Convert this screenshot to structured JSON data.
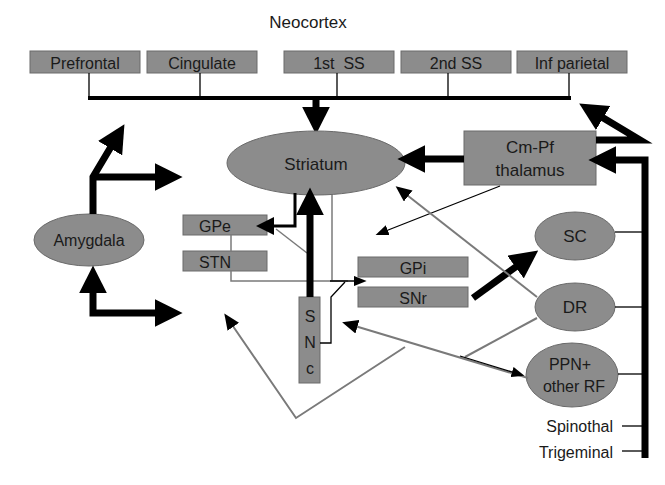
{
  "diagram": {
    "title": "Neocortex",
    "cortex_areas": [
      {
        "label": "Prefrontal"
      },
      {
        "label": "Cingulate"
      },
      {
        "label": "1st  SS"
      },
      {
        "label": "2nd SS"
      },
      {
        "label": "Inf parietal"
      }
    ],
    "nodes": {
      "striatum": "Striatum",
      "thalamus_line1": "Cm-Pf",
      "thalamus_line2": "thalamus",
      "amygdala": "Amygdala",
      "gpe": "GPe",
      "stn": "STN",
      "gpi": "GPi",
      "snr": "SNr",
      "snc_s": "S",
      "snc_n": "N",
      "snc_c": "c",
      "sc": "SC",
      "dr": "DR",
      "ppn_line1": "PPN+",
      "ppn_line2": "other RF"
    },
    "inputs": {
      "spinothal": "Spinothal",
      "trigeminal": "Trigeminal"
    },
    "colors": {
      "node_fill": "#8c8c8c",
      "thick_arrow": "#000000",
      "thin_gray_arrow": "#7a7a7a",
      "background": "#ffffff"
    },
    "connections": [
      {
        "from": "Neocortex",
        "to": "Striatum",
        "weight": "thick"
      },
      {
        "from": "Cm-Pf thalamus",
        "to": "Striatum",
        "weight": "thick"
      },
      {
        "from": "Cm-Pf thalamus",
        "to": "Neocortex",
        "weight": "thick"
      },
      {
        "from": "Brainstem/Spinal inputs",
        "to": "Cm-Pf thalamus",
        "weight": "thick"
      },
      {
        "from": "Amygdala",
        "to": "Neocortex/Striatum/Ventral targets",
        "weight": "thick"
      },
      {
        "from": "Striatum",
        "to": "GPe",
        "weight": "thick"
      },
      {
        "from": "SNc",
        "to": "Striatum",
        "weight": "thick"
      },
      {
        "from": "SNr",
        "to": "SC",
        "weight": "thick"
      },
      {
        "from": "STN",
        "to": "GPi/SNr",
        "weight": "thin"
      },
      {
        "from": "DR",
        "to": "Striatum",
        "weight": "thin"
      },
      {
        "from": "DR",
        "to": "SNc",
        "weight": "thin"
      },
      {
        "from": "SNc",
        "to": "PPN+ other RF",
        "weight": "thin"
      }
    ]
  }
}
